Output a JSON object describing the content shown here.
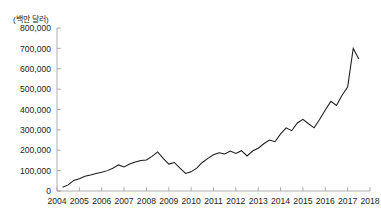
{
  "chart_data": {
    "type": "line",
    "title": "",
    "subtitle": "",
    "unit_label": "(백만 달러)",
    "xlabel": "",
    "ylabel": "",
    "ylim": [
      0,
      800000
    ],
    "xlim": [
      2004,
      2018
    ],
    "grid": false,
    "legend": null,
    "y_ticks": [
      0,
      100000,
      200000,
      300000,
      400000,
      500000,
      600000,
      700000,
      800000
    ],
    "y_tick_labels": [
      "0",
      "100,000",
      "200,000",
      "300,000",
      "400,000",
      "500,000",
      "600,000",
      "700,000",
      "800,000"
    ],
    "x_ticks": [
      2004,
      2005,
      2006,
      2007,
      2008,
      2009,
      2010,
      2011,
      2012,
      2013,
      2014,
      2015,
      2016,
      2017,
      2018
    ],
    "x_tick_labels": [
      "2004",
      "2005",
      "2006",
      "2007",
      "2008",
      "2009",
      "2010",
      "2011",
      "2012",
      "2013",
      "2014",
      "2015",
      "2016",
      "2017",
      "2018"
    ],
    "series": [
      {
        "name": "",
        "color": "#1a1a1a",
        "x": [
          2004.25,
          2004.5,
          2004.75,
          2005.0,
          2005.25,
          2005.5,
          2005.75,
          2006.0,
          2006.25,
          2006.5,
          2006.75,
          2007.0,
          2007.25,
          2007.5,
          2007.75,
          2008.0,
          2008.25,
          2008.5,
          2008.75,
          2009.0,
          2009.25,
          2009.5,
          2009.75,
          2010.0,
          2010.25,
          2010.5,
          2010.75,
          2011.0,
          2011.25,
          2011.5,
          2011.75,
          2012.0,
          2012.25,
          2012.5,
          2012.75,
          2013.0,
          2013.25,
          2013.5,
          2013.75,
          2014.0,
          2014.25,
          2014.5,
          2014.75,
          2015.0,
          2015.25,
          2015.5,
          2015.75,
          2016.0,
          2016.25,
          2016.5,
          2016.75,
          2017.0,
          2017.25,
          2017.5
        ],
        "values": [
          18000,
          30000,
          52000,
          60000,
          72000,
          78000,
          86000,
          92000,
          100000,
          112000,
          128000,
          118000,
          132000,
          142000,
          150000,
          152000,
          170000,
          192000,
          160000,
          132000,
          140000,
          112000,
          86000,
          94000,
          112000,
          140000,
          160000,
          178000,
          188000,
          182000,
          196000,
          184000,
          198000,
          172000,
          196000,
          210000,
          232000,
          250000,
          242000,
          280000,
          310000,
          296000,
          334000,
          352000,
          330000,
          310000,
          352000,
          398000,
          440000,
          420000,
          470000,
          510000,
          700000,
          648000
        ]
      }
    ]
  }
}
